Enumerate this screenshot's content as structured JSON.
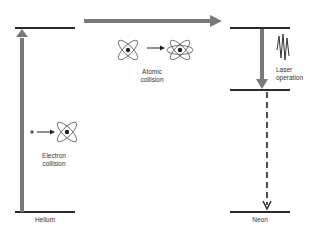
{
  "diagram": {
    "colors": {
      "level_line": "#2a2a2a",
      "thick_arrow": "#7a7a7a",
      "dark_arrow": "#222222",
      "atom_stroke": "#555555",
      "text": "#333333",
      "background": "#ffffff"
    },
    "labels": {
      "helium": "Helium",
      "neon": "Neon",
      "electron_collision_1": "Electron",
      "electron_collision_2": "collision",
      "atomic_collision_1": "Atomic",
      "atomic_collision_2": "collision",
      "laser_operation_1": "Laser",
      "laser_operation_2": "operation"
    },
    "nodes": [
      {
        "id": "helium-ground",
        "label": "Helium",
        "type": "energy-level"
      },
      {
        "id": "helium-excited",
        "type": "energy-level"
      },
      {
        "id": "neon-upper",
        "type": "energy-level"
      },
      {
        "id": "neon-lower",
        "type": "energy-level"
      },
      {
        "id": "neon-ground",
        "label": "Neon",
        "type": "energy-level"
      }
    ],
    "edges": [
      {
        "from": "helium-ground",
        "to": "helium-excited",
        "label": "Electron collision",
        "style": "thick-gray"
      },
      {
        "from": "helium-excited",
        "to": "neon-upper",
        "label": "Atomic collision",
        "style": "thick-gray"
      },
      {
        "from": "neon-upper",
        "to": "neon-lower",
        "label": "Laser operation",
        "style": "thick-gray"
      },
      {
        "from": "neon-lower",
        "to": "neon-ground",
        "style": "dashed"
      }
    ]
  }
}
